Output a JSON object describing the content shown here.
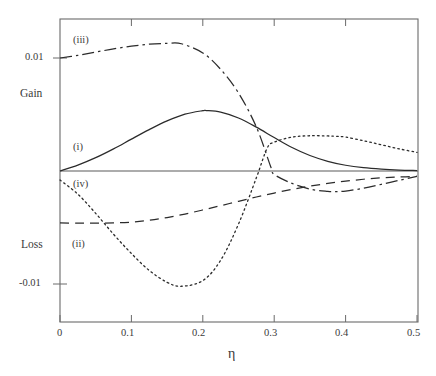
{
  "chart_data": {
    "type": "line",
    "title": "",
    "subtitle": "",
    "xlabel": "η",
    "ylabel": "",
    "ylabel_upper": "Gain",
    "ylabel_lower": "Loss",
    "xlim": [
      0,
      0.5
    ],
    "ylim": [
      -0.01385,
      0.01345
    ],
    "xticks": [
      0,
      0.1,
      0.2,
      0.3,
      0.4,
      0.5
    ],
    "xticklabels": [
      "0",
      "0.1",
      "0.2",
      "0.3",
      "0.4",
      "0.5"
    ],
    "yticks": [
      0.01,
      -0.01
    ],
    "yticklabels": [
      "0.01",
      "-0.01"
    ],
    "grid": false,
    "legend": "inline-annotations",
    "zero_line": 0,
    "annotations": [
      {
        "text": "(i)",
        "x": 0.018,
        "y": 0.0024
      },
      {
        "text": "(ii)",
        "x": 0.018,
        "y": -0.0062
      },
      {
        "text": "(iii)",
        "x": 0.018,
        "y": 0.0117
      },
      {
        "text": "(iv)",
        "x": 0.018,
        "y": -0.0012
      }
    ],
    "series": [
      {
        "name": "(i)",
        "style": "solid",
        "x": [
          0,
          0.025,
          0.05,
          0.075,
          0.1,
          0.125,
          0.15,
          0.175,
          0.2,
          0.205,
          0.225,
          0.25,
          0.275,
          0.3,
          0.325,
          0.35,
          0.375,
          0.4,
          0.425,
          0.45,
          0.475,
          0.5
        ],
        "y": [
          0,
          0.00052,
          0.00118,
          0.00196,
          0.00282,
          0.00366,
          0.00443,
          0.00503,
          0.00534,
          0.00535,
          0.00521,
          0.00469,
          0.00388,
          0.00296,
          0.00208,
          0.00137,
          0.00086,
          0.00051,
          0.00029,
          0.00016,
          8e-05,
          4e-05
        ]
      },
      {
        "name": "(ii)",
        "style": "dashed",
        "x": [
          0,
          0.025,
          0.05,
          0.075,
          0.1,
          0.125,
          0.15,
          0.175,
          0.2,
          0.225,
          0.25,
          0.275,
          0.3,
          0.325,
          0.35,
          0.375,
          0.4,
          0.425,
          0.45,
          0.475,
          0.5
        ],
        "y": [
          -0.0046,
          -0.00461,
          -0.00462,
          -0.0046,
          -0.00452,
          -0.00436,
          -0.00412,
          -0.00381,
          -0.00345,
          -0.00307,
          -0.00268,
          -0.0023,
          -0.00195,
          -0.00163,
          -0.00134,
          -0.0011,
          -0.0009,
          -0.00073,
          -0.00061,
          -0.00053,
          -0.00048
        ]
      },
      {
        "name": "(iii)",
        "style": "dash-dot",
        "x": [
          0,
          0.025,
          0.05,
          0.075,
          0.1,
          0.125,
          0.15,
          0.17,
          0.2,
          0.225,
          0.25,
          0.275,
          0.295,
          0.3,
          0.325,
          0.35,
          0.375,
          0.385,
          0.4,
          0.425,
          0.45,
          0.475,
          0.5
        ],
        "y": [
          0.01,
          0.01023,
          0.01052,
          0.01081,
          0.01105,
          0.01122,
          0.01129,
          0.01126,
          0.01045,
          0.009,
          0.0069,
          0.0039,
          0.0004,
          -0.0003,
          -0.0011,
          -0.0016,
          -0.0018,
          -0.00182,
          -0.00178,
          -0.00152,
          -0.00118,
          -0.00082,
          -0.00048
        ]
      },
      {
        "name": "(iv)",
        "style": "dotted",
        "x": [
          0,
          0.025,
          0.05,
          0.075,
          0.1,
          0.125,
          0.15,
          0.17,
          0.2,
          0.225,
          0.25,
          0.275,
          0.29,
          0.3,
          0.325,
          0.35,
          0.375,
          0.385,
          0.4,
          0.425,
          0.45,
          0.475,
          0.5
        ],
        "y": [
          -0.0008,
          -0.00205,
          -0.00375,
          -0.0056,
          -0.0073,
          -0.0088,
          -0.00985,
          -0.0102,
          -0.0097,
          -0.0079,
          -0.0047,
          -0.0006,
          0.002,
          0.00255,
          0.003,
          0.00312,
          0.0031,
          0.00308,
          0.003,
          0.00268,
          0.00232,
          0.00196,
          0.00165
        ]
      }
    ]
  },
  "axes": {
    "y_upper_label": "Gain",
    "y_lower_label": "Loss",
    "x_axis_title": "η",
    "y_tick_top": "0.01",
    "y_tick_bottom": "-0.01",
    "x_tick_0": "0",
    "x_tick_1": "0.1",
    "x_tick_2": "0.2",
    "x_tick_3": "0.3",
    "x_tick_4": "0.4",
    "x_tick_5": "0.5"
  },
  "curve_tags": {
    "i": "(i)",
    "ii": "(ii)",
    "iii": "(iii)",
    "iv": "(iv)"
  },
  "colors": {
    "background": "#ffffff",
    "axis": "#555555",
    "curve": "#2b2b2b",
    "text": "#3a3a3a"
  }
}
